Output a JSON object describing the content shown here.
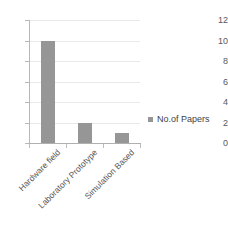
{
  "chart_data": {
    "type": "bar",
    "title": "",
    "subtitle": "",
    "xlabel": "",
    "ylabel": "",
    "categories": [
      "Hardware field",
      "Laboratory Prototype",
      "Simulation Based"
    ],
    "series": [
      {
        "name": "No.of Papers",
        "values": [
          10,
          2,
          1
        ],
        "color": "#969696"
      }
    ],
    "ylim": [
      0,
      12
    ],
    "y_ticks": [
      0,
      2,
      4,
      6,
      8,
      10,
      12
    ],
    "y_tick_labels": [
      "0",
      "2",
      "4",
      "6",
      "8",
      "10",
      "12"
    ],
    "grid": true,
    "grid_color": "#e9e9e9",
    "legend": {
      "position": "right",
      "entries": [
        {
          "label": "No.of Papers",
          "color": "#969696",
          "marker": "square-marker"
        }
      ]
    },
    "axis_color": "#b8b8b8",
    "tick_label_color": "#595959",
    "category_label_rotation": -45,
    "background": "#ffffff"
  }
}
